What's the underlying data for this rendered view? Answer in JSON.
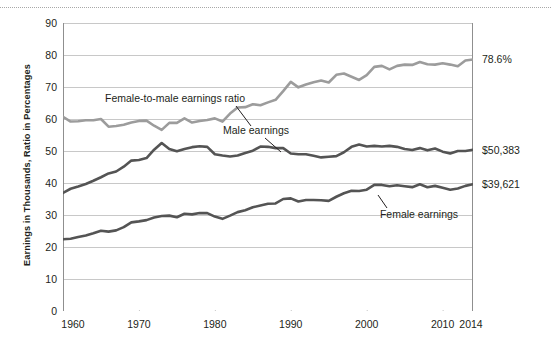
{
  "chart_data": {
    "type": "line",
    "title": "",
    "xlabel": "",
    "ylabel": "Earnings in Thousands, Ratio in Percentages",
    "xlim": [
      1960,
      2014
    ],
    "ylim": [
      0,
      90
    ],
    "ytick_step": 10,
    "yticks": [
      "0",
      "10",
      "20",
      "30",
      "40",
      "50",
      "60",
      "70",
      "80",
      "90"
    ],
    "xticks": [
      "1960",
      "1970",
      "1980",
      "1990",
      "2000",
      "2010",
      "2014"
    ],
    "xtick_values": [
      1960,
      1970,
      1980,
      1990,
      2000,
      2010,
      2014
    ],
    "grid": "horizontal",
    "legend_position": "inline-annotations",
    "x": [
      1960,
      1961,
      1962,
      1963,
      1964,
      1965,
      1966,
      1967,
      1968,
      1969,
      1970,
      1971,
      1972,
      1973,
      1974,
      1975,
      1976,
      1977,
      1978,
      1979,
      1980,
      1981,
      1982,
      1983,
      1984,
      1985,
      1986,
      1987,
      1988,
      1989,
      1990,
      1991,
      1992,
      1993,
      1994,
      1995,
      1996,
      1997,
      1998,
      1999,
      2000,
      2001,
      2002,
      2003,
      2004,
      2005,
      2006,
      2007,
      2008,
      2009,
      2010,
      2011,
      2012,
      2013,
      2014
    ],
    "series": [
      {
        "name": "Female-to-male earnings ratio",
        "color": "#9c9c9c",
        "unit": "percent",
        "end_label": "78.6%",
        "values": [
          60.7,
          59.2,
          59.3,
          59.6,
          59.6,
          60.0,
          57.6,
          57.8,
          58.2,
          58.9,
          59.4,
          59.5,
          57.9,
          56.6,
          58.8,
          58.8,
          60.2,
          58.9,
          59.4,
          59.7,
          60.2,
          59.2,
          61.7,
          63.6,
          63.7,
          64.6,
          64.3,
          65.2,
          66.0,
          68.7,
          71.6,
          69.9,
          70.8,
          71.5,
          72.0,
          71.4,
          73.8,
          74.2,
          73.2,
          72.2,
          73.7,
          76.3,
          76.6,
          75.5,
          76.6,
          77.0,
          76.9,
          77.8,
          77.1,
          77.0,
          77.4,
          77.0,
          76.5,
          78.3,
          78.6
        ]
      },
      {
        "name": "Male earnings",
        "color": "#545454",
        "unit": "thousands-of-dollars",
        "end_label": "$50,383",
        "values": [
          36.9,
          38.2,
          38.9,
          39.7,
          40.7,
          41.8,
          43.0,
          43.6,
          45.1,
          47.0,
          47.2,
          47.8,
          50.4,
          52.5,
          50.6,
          49.9,
          50.6,
          51.2,
          51.5,
          51.3,
          49.0,
          48.6,
          48.3,
          48.6,
          49.4,
          50.1,
          51.4,
          51.3,
          50.9,
          50.9,
          49.2,
          49.0,
          49.0,
          48.5,
          48.0,
          48.2,
          48.4,
          49.6,
          51.3,
          52.0,
          51.4,
          51.6,
          51.4,
          51.6,
          51.3,
          50.6,
          50.3,
          50.9,
          50.2,
          50.8,
          49.8,
          49.2,
          50.0,
          50.0,
          50.4
        ]
      },
      {
        "name": "Female earnings",
        "color": "#545454",
        "unit": "thousands-of-dollars",
        "end_label": "$39,621",
        "values": [
          22.4,
          22.6,
          23.1,
          23.6,
          24.3,
          25.1,
          24.8,
          25.2,
          26.2,
          27.7,
          28.0,
          28.4,
          29.2,
          29.7,
          29.8,
          29.3,
          30.4,
          30.2,
          30.6,
          30.6,
          29.5,
          28.8,
          29.8,
          30.9,
          31.5,
          32.4,
          33.0,
          33.5,
          33.6,
          35.0,
          35.2,
          34.2,
          34.7,
          34.7,
          34.6,
          34.4,
          35.7,
          36.8,
          37.6,
          37.5,
          37.9,
          39.4,
          39.4,
          39.0,
          39.3,
          39.0,
          38.7,
          39.6,
          38.7,
          39.1,
          38.5,
          37.9,
          38.3,
          39.1,
          39.6
        ]
      }
    ],
    "annotations": [
      {
        "name": "ratio-annotation",
        "text": "Female-to-male earnings ratio",
        "label_x": 175,
        "label_y": 98,
        "leader": {
          "x1": 236,
          "y1": 106,
          "x2": 251,
          "y2": 126
        }
      },
      {
        "name": "male-earnings-annotation",
        "text": "Male earnings",
        "label_x": 256,
        "label_y": 130,
        "leader": {
          "x1": 265,
          "y1": 138,
          "x2": 281,
          "y2": 152
        }
      },
      {
        "name": "female-earnings-annotation",
        "text": "Female earnings",
        "label_x": 419,
        "label_y": 214,
        "leader": {
          "x1": 387,
          "y1": 208,
          "x2": 378,
          "y2": 195
        }
      }
    ]
  }
}
